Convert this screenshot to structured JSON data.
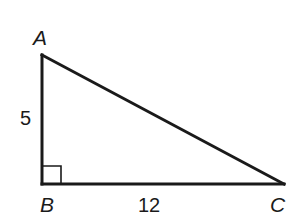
{
  "diagram": {
    "type": "right-triangle",
    "vertices": {
      "A": {
        "label": "A",
        "x": 42,
        "y": 55
      },
      "B": {
        "label": "B",
        "x": 42,
        "y": 184
      },
      "C": {
        "label": "C",
        "x": 284,
        "y": 184
      }
    },
    "sides": {
      "AB": {
        "label": "5"
      },
      "BC": {
        "label": "12"
      },
      "AC": {
        "label": ""
      }
    },
    "right_angle_at": "B",
    "colors": {
      "stroke": "#1a1a1a",
      "background": "#ffffff"
    }
  }
}
